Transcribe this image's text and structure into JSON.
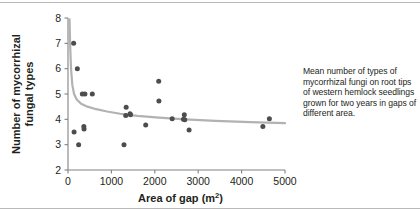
{
  "caption": {
    "text": "Mean number of types of mycorrhizal fungi on root tips of western hemlock seedlings grown for two years in gaps of different area."
  },
  "axes": {
    "x_title": "Area of gap (m",
    "x_title_sup": "2",
    "x_title_close": ")",
    "y_title_line1": "Number of mycorrhizal",
    "y_title_line2": "fungal types"
  },
  "chart_data": {
    "type": "scatter",
    "title": "",
    "xlabel": "Area of gap (m2)",
    "ylabel": "Number of mycorrhizal fungal types",
    "xlim": [
      0,
      5000
    ],
    "ylim": [
      2,
      8
    ],
    "xticks": [
      0,
      1000,
      2000,
      3000,
      4000,
      5000
    ],
    "yticks": [
      2,
      3,
      4,
      5,
      6,
      7,
      8
    ],
    "xtick_labels": [
      "0",
      "1000",
      "2000",
      "3000",
      "4000",
      "5000"
    ],
    "ytick_labels": [
      "2",
      "3",
      "4",
      "5",
      "6",
      "7",
      "8"
    ],
    "grid": false,
    "legend": false,
    "marker_color": "#4d4d4f",
    "curve_color": "#b2b2b2",
    "axis_color": "#808285",
    "points": [
      {
        "x": 130,
        "y": 7.0
      },
      {
        "x": 140,
        "y": 3.5
      },
      {
        "x": 215,
        "y": 6.0
      },
      {
        "x": 245,
        "y": 3.0
      },
      {
        "x": 330,
        "y": 5.0
      },
      {
        "x": 390,
        "y": 5.0
      },
      {
        "x": 365,
        "y": 3.72
      },
      {
        "x": 370,
        "y": 3.62
      },
      {
        "x": 560,
        "y": 5.0
      },
      {
        "x": 1290,
        "y": 3.0
      },
      {
        "x": 1340,
        "y": 4.48
      },
      {
        "x": 1330,
        "y": 4.15
      },
      {
        "x": 1430,
        "y": 4.22
      },
      {
        "x": 1440,
        "y": 4.18
      },
      {
        "x": 1790,
        "y": 3.78
      },
      {
        "x": 2090,
        "y": 5.5
      },
      {
        "x": 2095,
        "y": 4.72
      },
      {
        "x": 2400,
        "y": 4.02
      },
      {
        "x": 2680,
        "y": 4.18
      },
      {
        "x": 2660,
        "y": 4.0
      },
      {
        "x": 2690,
        "y": 3.98
      },
      {
        "x": 2790,
        "y": 3.58
      },
      {
        "x": 4490,
        "y": 3.72
      },
      {
        "x": 4640,
        "y": 4.02
      }
    ],
    "fit_curve": {
      "description": "decaying power-law fit through scatter",
      "points": [
        {
          "x": 35,
          "y": 7.95
        },
        {
          "x": 50,
          "y": 6.9
        },
        {
          "x": 70,
          "y": 6.0
        },
        {
          "x": 100,
          "y": 5.35
        },
        {
          "x": 140,
          "y": 5.0
        },
        {
          "x": 200,
          "y": 4.78
        },
        {
          "x": 300,
          "y": 4.62
        },
        {
          "x": 450,
          "y": 4.5
        },
        {
          "x": 650,
          "y": 4.4
        },
        {
          "x": 900,
          "y": 4.31
        },
        {
          "x": 1200,
          "y": 4.22
        },
        {
          "x": 1600,
          "y": 4.14
        },
        {
          "x": 2100,
          "y": 4.07
        },
        {
          "x": 2700,
          "y": 4.0
        },
        {
          "x": 3400,
          "y": 3.94
        },
        {
          "x": 4200,
          "y": 3.89
        },
        {
          "x": 5000,
          "y": 3.85
        }
      ]
    }
  }
}
